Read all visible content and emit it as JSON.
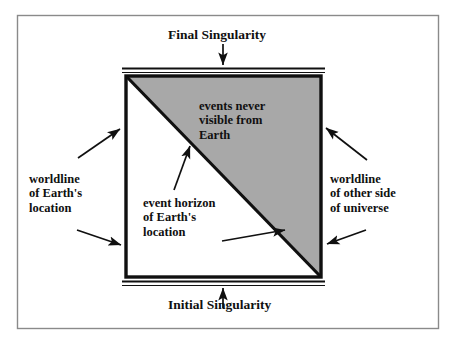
{
  "figure": {
    "type": "spacetime-conformal-diagram",
    "background_color": "#ffffff",
    "frame_color": "#808080",
    "line_color": "#000000",
    "shaded_region_color": "#a8a8a8",
    "text_color": "#101010"
  },
  "labels": {
    "final_singularity": "Final Singularity",
    "initial_singularity": "Initial Singularity",
    "events_never_visible": "events never\nvisible from\nEarth",
    "worldline_of_earth": "worldline\nof Earth's\nlocation",
    "worldline_of_other_side": "worldline\nof other side\nof universe",
    "event_horizon": "event horizon\nof Earth's\nlocation"
  },
  "regions": {
    "shaded_triangle_name": "events never visible from Earth",
    "unshaded_triangle_name": "events visible from Earth"
  },
  "elements": {
    "square_name": "spacetime-square",
    "diagonal_name": "event-horizon-diagonal",
    "top_boundary_name": "final-singularity-line",
    "bottom_boundary_name": "initial-singularity-line",
    "left_boundary_name": "earth-worldline-edge",
    "right_boundary_name": "other-side-worldline-edge"
  },
  "arrows": {
    "final_singularity_arrow": "down",
    "initial_singularity_arrow": "up",
    "worldline_earth_upper_arrow": "up-right",
    "worldline_earth_lower_arrow": "down-right",
    "worldline_other_upper_arrow": "up-left",
    "worldline_other_lower_arrow": "down-left",
    "event_horizon_upper_arrow": "up-right",
    "event_horizon_lower_arrow": "right"
  }
}
